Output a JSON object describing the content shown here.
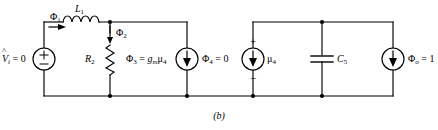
{
  "figure": {
    "caption": "(b)",
    "type": "electrical-circuit-schematic",
    "line_color": "#000000",
    "background_color": "#ffffff"
  },
  "labels": {
    "source_vi_value": "= 0",
    "source_vi_symbol_v": "V",
    "source_vi_symbol_hat": "^",
    "source_vi_symbol_sub": "i",
    "source_vi_plus": "+",
    "source_vi_minus": "−",
    "flux1": "Φ",
    "flux1_sub": "1",
    "inductor_name": "L",
    "inductor_sub": "1",
    "flux2": "Φ",
    "flux2_sub": "2",
    "resistor_name": "R",
    "resistor_sub": "2",
    "flux3": "Φ",
    "flux3_sub": "3",
    "flux3_eq": "=",
    "flux3_gm": "g",
    "flux3_gm_sub": "m",
    "flux3_mu": "μ",
    "flux3_mu_sub": "4",
    "flux4": "Φ",
    "flux4_sub": "4",
    "flux4_value": "= 0",
    "mu4": "μ",
    "mu4_sub": "4",
    "source_mu4_plus": "+",
    "source_mu4_minus": "−",
    "capacitor_name": "C",
    "capacitor_sub": "5",
    "flux0": "Φ",
    "flux0_sub": "o",
    "flux0_value": "= 1"
  },
  "components": [
    {
      "name": "voltage-source-vi",
      "kind": "voltage-source",
      "label": "V̂i = 0",
      "x": 44,
      "y": 59
    },
    {
      "name": "inductor-l1",
      "kind": "inductor",
      "label": "L1",
      "x": 80,
      "y": 22
    },
    {
      "name": "resistor-r2",
      "kind": "resistor",
      "label": "R2",
      "x": 110,
      "y": 59
    },
    {
      "name": "current-source-phi3",
      "kind": "current-source",
      "label": "Φ3 = gmμ4",
      "x": 187,
      "y": 59
    },
    {
      "name": "current-source-phi4",
      "kind": "current-source",
      "label": "Φ4 = 0",
      "x": 253,
      "y": 59
    },
    {
      "name": "capacitor-c5",
      "kind": "capacitor",
      "label": "C5",
      "x": 322,
      "y": 59
    },
    {
      "name": "current-source-phi0",
      "kind": "current-source",
      "label": "Φo = 1",
      "x": 393,
      "y": 59
    }
  ],
  "nodes": [
    {
      "name": "junction-r2-top",
      "x": 110,
      "y": 22
    },
    {
      "name": "junction-r2-bottom",
      "x": 110,
      "y": 96
    },
    {
      "name": "junction-phi3-bottom",
      "x": 187,
      "y": 96
    },
    {
      "name": "junction-phi4-bottom",
      "x": 253,
      "y": 96
    },
    {
      "name": "junction-c5-top",
      "x": 322,
      "y": 22
    },
    {
      "name": "junction-c5-bottom",
      "x": 322,
      "y": 96
    }
  ]
}
